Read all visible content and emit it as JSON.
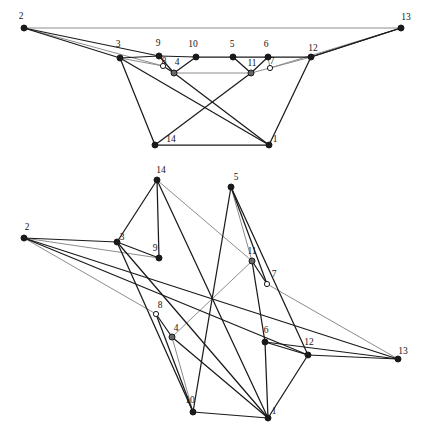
{
  "figure": {
    "title": "",
    "background_color": "#ffffff",
    "edge_color_dark": "#1a1a1a",
    "edge_color_light": "#8c8c8c",
    "node_fill_solid": "#1a1a1a",
    "node_fill_hollow": "#ffffff",
    "node_fill_gray": "#666666",
    "node_stroke": "#1a1a1a"
  },
  "graphs": [
    {
      "name": "upper-drawing",
      "nodes": [
        {
          "id": "2",
          "label": "2",
          "x": 24,
          "y": 28,
          "lx": 21,
          "ly": 19,
          "style": "solid"
        },
        {
          "id": "13",
          "label": "13",
          "x": 401,
          "y": 28,
          "lx": 406,
          "ly": 20,
          "style": "solid"
        },
        {
          "id": "3",
          "label": "3",
          "x": 120,
          "y": 58,
          "lx": 118,
          "ly": 47,
          "style": "solid"
        },
        {
          "id": "9",
          "label": "9",
          "x": 159,
          "y": 56,
          "lx": 158,
          "ly": 46,
          "style": "solid"
        },
        {
          "id": "10",
          "label": "10",
          "x": 196,
          "y": 57,
          "lx": 193,
          "ly": 47,
          "style": "solid"
        },
        {
          "id": "5",
          "label": "5",
          "x": 233,
          "y": 57,
          "lx": 232,
          "ly": 47,
          "style": "solid"
        },
        {
          "id": "6",
          "label": "6",
          "x": 268,
          "y": 57,
          "lx": 266,
          "ly": 47,
          "style": "solid"
        },
        {
          "id": "12",
          "label": "12",
          "x": 311,
          "y": 57,
          "lx": 313,
          "ly": 51,
          "style": "solid"
        },
        {
          "id": "8",
          "label": "8",
          "x": 163,
          "y": 66,
          "lx": 164,
          "ly": 64,
          "style": "hollow"
        },
        {
          "id": "4",
          "label": "4",
          "x": 174,
          "y": 73,
          "lx": 177,
          "ly": 65,
          "style": "gray"
        },
        {
          "id": "11",
          "label": "11",
          "x": 251,
          "y": 73,
          "lx": 252,
          "ly": 66,
          "style": "gray"
        },
        {
          "id": "7",
          "label": "7",
          "x": 270,
          "y": 68,
          "lx": 272,
          "ly": 64,
          "style": "hollow"
        },
        {
          "id": "14",
          "label": "14",
          "x": 155,
          "y": 145,
          "lx": 171,
          "ly": 142,
          "style": "solid"
        },
        {
          "id": "1",
          "label": "1",
          "x": 269,
          "y": 145,
          "lx": 275,
          "ly": 142,
          "style": "solid"
        }
      ],
      "edges": [
        {
          "from": "2",
          "to": "13",
          "shade": "light"
        },
        {
          "from": "2",
          "to": "3",
          "shade": "dark"
        },
        {
          "from": "2",
          "to": "9",
          "shade": "dark"
        },
        {
          "from": "2",
          "to": "8",
          "shade": "light"
        },
        {
          "from": "3",
          "to": "9",
          "shade": "dark"
        },
        {
          "from": "3",
          "to": "8",
          "shade": "light"
        },
        {
          "from": "3",
          "to": "14",
          "shade": "dark"
        },
        {
          "from": "3",
          "to": "1",
          "shade": "dark"
        },
        {
          "from": "9",
          "to": "10",
          "shade": "dark"
        },
        {
          "from": "9",
          "to": "4",
          "shade": "dark"
        },
        {
          "from": "8",
          "to": "4",
          "shade": "dark"
        },
        {
          "from": "4",
          "to": "11",
          "shade": "light"
        },
        {
          "from": "4",
          "to": "1",
          "shade": "dark"
        },
        {
          "from": "10",
          "to": "5",
          "shade": "dark"
        },
        {
          "from": "10",
          "to": "4",
          "shade": "dark"
        },
        {
          "from": "5",
          "to": "6",
          "shade": "dark"
        },
        {
          "from": "5",
          "to": "11",
          "shade": "dark"
        },
        {
          "from": "6",
          "to": "11",
          "shade": "dark"
        },
        {
          "from": "6",
          "to": "12",
          "shade": "dark"
        },
        {
          "from": "6",
          "to": "7",
          "shade": "light"
        },
        {
          "from": "11",
          "to": "7",
          "shade": "light"
        },
        {
          "from": "11",
          "to": "14",
          "shade": "dark"
        },
        {
          "from": "7",
          "to": "12",
          "shade": "light"
        },
        {
          "from": "7",
          "to": "13",
          "shade": "light"
        },
        {
          "from": "12",
          "to": "13",
          "shade": "dark"
        },
        {
          "from": "12",
          "to": "1",
          "shade": "dark"
        },
        {
          "from": "13",
          "to": "12",
          "shade": "dark"
        },
        {
          "from": "14",
          "to": "1",
          "shade": "dark"
        }
      ]
    },
    {
      "name": "lower-drawing",
      "nodes": [
        {
          "id": "14",
          "label": "14",
          "x": 157,
          "y": 180,
          "lx": 161,
          "ly": 173,
          "style": "solid"
        },
        {
          "id": "5",
          "label": "5",
          "x": 231,
          "y": 187,
          "lx": 236,
          "ly": 180,
          "style": "solid"
        },
        {
          "id": "2",
          "label": "2",
          "x": 24,
          "y": 238,
          "lx": 27,
          "ly": 230,
          "style": "solid"
        },
        {
          "id": "3",
          "label": "3",
          "x": 117,
          "y": 242,
          "lx": 122,
          "ly": 240,
          "style": "solid"
        },
        {
          "id": "9",
          "label": "9",
          "x": 159,
          "y": 258,
          "lx": 155,
          "ly": 251,
          "style": "solid"
        },
        {
          "id": "11",
          "label": "11",
          "x": 252,
          "y": 261,
          "lx": 252,
          "ly": 254,
          "style": "gray"
        },
        {
          "id": "7",
          "label": "7",
          "x": 267,
          "y": 284,
          "lx": 274,
          "ly": 277,
          "style": "hollow"
        },
        {
          "id": "8",
          "label": "8",
          "x": 156,
          "y": 314,
          "lx": 160,
          "ly": 308,
          "style": "hollow"
        },
        {
          "id": "4",
          "label": "4",
          "x": 172,
          "y": 337,
          "lx": 176,
          "ly": 331,
          "style": "gray"
        },
        {
          "id": "6",
          "label": "6",
          "x": 265,
          "y": 342,
          "lx": 266,
          "ly": 333,
          "style": "solid"
        },
        {
          "id": "12",
          "label": "12",
          "x": 308,
          "y": 355,
          "lx": 309,
          "ly": 345,
          "style": "solid"
        },
        {
          "id": "13",
          "label": "13",
          "x": 398,
          "y": 359,
          "lx": 403,
          "ly": 354,
          "style": "solid"
        },
        {
          "id": "10",
          "label": "10",
          "x": 193,
          "y": 412,
          "lx": 190,
          "ly": 403,
          "style": "solid"
        },
        {
          "id": "1",
          "label": "1",
          "x": 268,
          "y": 418,
          "lx": 274,
          "ly": 414,
          "style": "solid"
        }
      ],
      "edges": [
        {
          "from": "2",
          "to": "3",
          "shade": "dark"
        },
        {
          "from": "2",
          "to": "9",
          "shade": "light"
        },
        {
          "from": "2",
          "to": "8",
          "shade": "light"
        },
        {
          "from": "2",
          "to": "13",
          "shade": "dark"
        },
        {
          "from": "2",
          "to": "12",
          "shade": "dark"
        },
        {
          "from": "3",
          "to": "9",
          "shade": "dark"
        },
        {
          "from": "3",
          "to": "14",
          "shade": "dark"
        },
        {
          "from": "3",
          "to": "10",
          "shade": "dark"
        },
        {
          "from": "3",
          "to": "1",
          "shade": "dark"
        },
        {
          "from": "14",
          "to": "9",
          "shade": "dark"
        },
        {
          "from": "14",
          "to": "11",
          "shade": "light"
        },
        {
          "from": "14",
          "to": "1",
          "shade": "dark"
        },
        {
          "from": "5",
          "to": "11",
          "shade": "light"
        },
        {
          "from": "5",
          "to": "7",
          "shade": "dark"
        },
        {
          "from": "5",
          "to": "10",
          "shade": "dark"
        },
        {
          "from": "5",
          "to": "12",
          "shade": "dark"
        },
        {
          "from": "11",
          "to": "7",
          "shade": "dark"
        },
        {
          "from": "11",
          "to": "4",
          "shade": "light"
        },
        {
          "from": "11",
          "to": "6",
          "shade": "dark"
        },
        {
          "from": "7",
          "to": "13",
          "shade": "light"
        },
        {
          "from": "8",
          "to": "4",
          "shade": "dark"
        },
        {
          "from": "8",
          "to": "10",
          "shade": "dark"
        },
        {
          "from": "4",
          "to": "10",
          "shade": "light"
        },
        {
          "from": "4",
          "to": "1",
          "shade": "dark"
        },
        {
          "from": "6",
          "to": "12",
          "shade": "dark"
        },
        {
          "from": "6",
          "to": "1",
          "shade": "dark"
        },
        {
          "from": "12",
          "to": "13",
          "shade": "dark"
        },
        {
          "from": "12",
          "to": "1",
          "shade": "dark"
        },
        {
          "from": "13",
          "to": "6",
          "shade": "dark"
        },
        {
          "from": "10",
          "to": "1",
          "shade": "dark"
        }
      ]
    }
  ]
}
